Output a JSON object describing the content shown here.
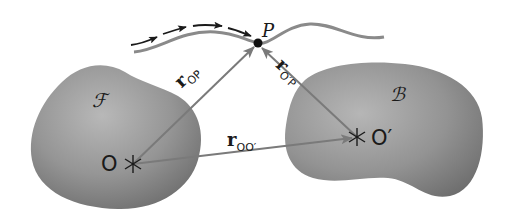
{
  "figure": {
    "type": "diagram",
    "colors": {
      "background": "#ffffff",
      "body_fill_light": "#b4b4b4",
      "body_fill_dark": "#6e6e6e",
      "arrow": "#7a7a7a",
      "curve": "#8a8a8a",
      "path_arrows": "#1a1a1a",
      "text": "#1a1a1a"
    },
    "bodies": [
      {
        "id": "frame-F",
        "label": "ℱ",
        "origin_label": "O",
        "origin_marker": "✱"
      },
      {
        "id": "frame-B",
        "label": "ℬ",
        "origin_label": "O′",
        "origin_marker": "✱"
      }
    ],
    "point": {
      "label": "P"
    },
    "vectors": [
      {
        "id": "r_OP",
        "symbol": "r",
        "subscript": "OP",
        "from": "O",
        "to": "P"
      },
      {
        "id": "r_O'P",
        "symbol": "r",
        "subscript": "O′P",
        "from": "O′",
        "to": "P"
      },
      {
        "id": "r_OO'",
        "symbol": "r",
        "subscript": "OO′",
        "from": "O",
        "to": "O′"
      }
    ],
    "trajectory": {
      "description": "Path of point P with dashed direction arrows"
    }
  }
}
